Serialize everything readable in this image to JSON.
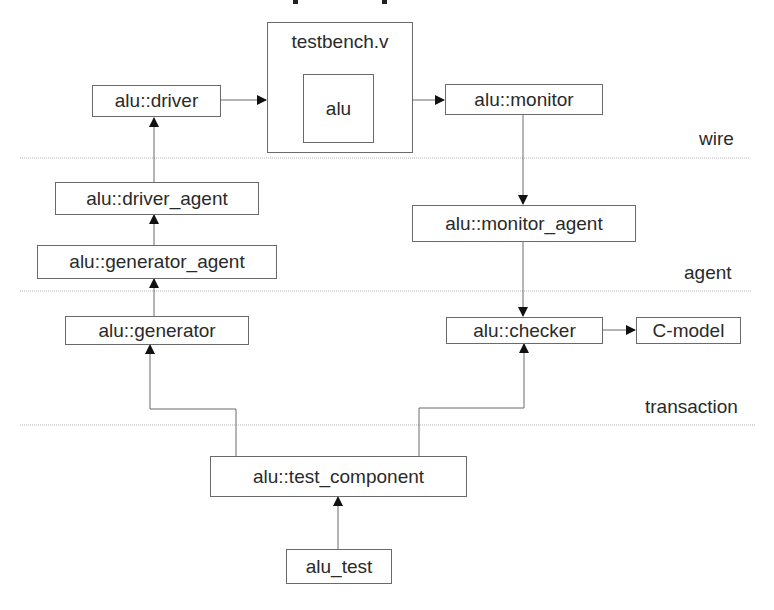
{
  "diagram": {
    "type": "block-diagram",
    "layers": [
      {
        "id": "wire",
        "label": "wire"
      },
      {
        "id": "agent",
        "label": "agent"
      },
      {
        "id": "transaction",
        "label": "transaction"
      }
    ],
    "nodes": {
      "testbench": {
        "label": "testbench.v"
      },
      "alu": {
        "label": "alu"
      },
      "driver": {
        "label": "alu::driver"
      },
      "monitor": {
        "label": "alu::monitor"
      },
      "driver_agent": {
        "label": "alu::driver_agent"
      },
      "generator_agent": {
        "label": "alu::generator_agent"
      },
      "monitor_agent": {
        "label": "alu::monitor_agent"
      },
      "generator": {
        "label": "alu::generator"
      },
      "checker": {
        "label": "alu::checker"
      },
      "c_model": {
        "label": "C-model"
      },
      "test_component": {
        "label": "alu::test_component"
      },
      "alu_test": {
        "label": "alu_test"
      }
    },
    "edges": [
      {
        "from": "driver",
        "to": "testbench"
      },
      {
        "from": "testbench",
        "to": "monitor"
      },
      {
        "from": "driver_agent",
        "to": "driver"
      },
      {
        "from": "generator_agent",
        "to": "driver_agent"
      },
      {
        "from": "generator",
        "to": "generator_agent"
      },
      {
        "from": "monitor",
        "to": "monitor_agent"
      },
      {
        "from": "monitor_agent",
        "to": "checker"
      },
      {
        "from": "checker",
        "to": "c_model"
      },
      {
        "from": "test_component",
        "to": "generator"
      },
      {
        "from": "test_component",
        "to": "checker"
      },
      {
        "from": "alu_test",
        "to": "test_component"
      }
    ],
    "colors": {
      "line": "#6a6a6a",
      "separator": "#b5b5b5",
      "arrow": "#111111",
      "text": "#2a2a2a"
    }
  }
}
